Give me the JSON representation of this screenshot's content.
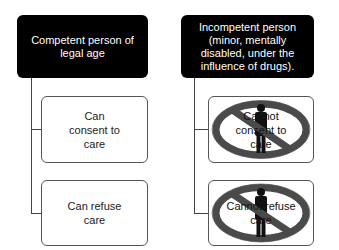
{
  "diagram": {
    "left": {
      "header": "Competent person of legal age",
      "children": [
        {
          "label": "Can consent to care"
        },
        {
          "label": "Can refuse care"
        }
      ]
    },
    "right": {
      "header": "Incompetent person (minor, mentally disabled, under the influence of drugs).",
      "children": [
        {
          "label": "Cannot consent to care",
          "icon": "prohibited-person-icon"
        },
        {
          "label": "Cannot refuse care",
          "icon": "prohibited-person-icon"
        }
      ]
    }
  },
  "colors": {
    "header_bg": "#000000",
    "header_text": "#ffffff",
    "prohibition_ring": "#4a4a4a",
    "person_figure": "#111111"
  }
}
